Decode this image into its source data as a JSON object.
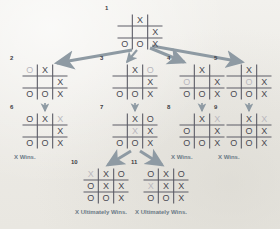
{
  "diagram": {
    "colors": {
      "background": "#efeeea",
      "grid_line": "#5c5c66",
      "mark": "#4a4a52",
      "mark_new": "#b9b7bd",
      "arrow": "#8e9aa3",
      "caption": "#6b7a86",
      "number": "#3c3c44"
    },
    "mark_symbols": {
      "x": "X",
      "o": "O",
      "empty": ""
    }
  },
  "nodes": [
    {
      "id": "node-1",
      "number": "1",
      "x": 117,
      "y": 14,
      "rows": [
        [
          "",
          "x",
          ""
        ],
        [
          "",
          "",
          "x"
        ],
        [
          "o",
          "o",
          "x"
        ]
      ],
      "new_cells": [],
      "caption": ""
    },
    {
      "id": "node-2",
      "number": "2",
      "x": 22,
      "y": 64,
      "rows": [
        [
          "o",
          "x",
          ""
        ],
        [
          "",
          "",
          "x"
        ],
        [
          "o",
          "o",
          "x"
        ]
      ],
      "new_cells": [
        [
          0,
          0
        ]
      ],
      "caption": ""
    },
    {
      "id": "node-3",
      "number": "3",
      "x": 112,
      "y": 64,
      "rows": [
        [
          "",
          "x",
          "o"
        ],
        [
          "",
          "",
          "x"
        ],
        [
          "o",
          "o",
          "x"
        ]
      ],
      "new_cells": [
        [
          0,
          2
        ]
      ],
      "caption": ""
    },
    {
      "id": "node-4",
      "number": "4",
      "x": 179,
      "y": 64,
      "rows": [
        [
          "",
          "x",
          ""
        ],
        [
          "o",
          "",
          "x"
        ],
        [
          "o",
          "o",
          "x"
        ]
      ],
      "new_cells": [
        [
          1,
          0
        ]
      ],
      "caption": ""
    },
    {
      "id": "node-5",
      "number": "5",
      "x": 226,
      "y": 64,
      "rows": [
        [
          "",
          "x",
          ""
        ],
        [
          "",
          "o",
          "x"
        ],
        [
          "o",
          "o",
          "x"
        ]
      ],
      "new_cells": [
        [
          1,
          1
        ]
      ],
      "caption": ""
    },
    {
      "id": "node-6",
      "number": "6",
      "x": 22,
      "y": 113,
      "rows": [
        [
          "o",
          "x",
          "x"
        ],
        [
          "",
          "",
          "x"
        ],
        [
          "o",
          "o",
          "x"
        ]
      ],
      "new_cells": [
        [
          0,
          2
        ]
      ],
      "caption": "X Wins."
    },
    {
      "id": "node-7",
      "number": "7",
      "x": 112,
      "y": 113,
      "rows": [
        [
          "",
          "x",
          "o"
        ],
        [
          "",
          "x",
          "x"
        ],
        [
          "o",
          "o",
          "x"
        ]
      ],
      "new_cells": [
        [
          1,
          1
        ]
      ],
      "caption": ""
    },
    {
      "id": "node-8",
      "number": "8",
      "x": 179,
      "y": 113,
      "rows": [
        [
          "",
          "x",
          "x"
        ],
        [
          "o",
          "",
          "x"
        ],
        [
          "o",
          "o",
          "x"
        ]
      ],
      "new_cells": [
        [
          0,
          2
        ]
      ],
      "caption": "X Wins."
    },
    {
      "id": "node-9",
      "number": "9",
      "x": 226,
      "y": 113,
      "rows": [
        [
          "",
          "x",
          "x"
        ],
        [
          "",
          "o",
          "x"
        ],
        [
          "o",
          "o",
          "x"
        ]
      ],
      "new_cells": [
        [
          0,
          2
        ]
      ],
      "caption": "X Wins."
    },
    {
      "id": "node-10",
      "number": "10",
      "x": 83,
      "y": 168,
      "rows": [
        [
          "x",
          "x",
          "o"
        ],
        [
          "o",
          "x",
          "x"
        ],
        [
          "o",
          "o",
          "x"
        ]
      ],
      "new_cells": [
        [
          0,
          0
        ]
      ],
      "caption": "X Ultimately Wins."
    },
    {
      "id": "node-11",
      "number": "11",
      "x": 143,
      "y": 168,
      "rows": [
        [
          "o",
          "x",
          "o"
        ],
        [
          "x",
          "x",
          "x"
        ],
        [
          "o",
          "o",
          "x"
        ]
      ],
      "new_cells": [
        [
          1,
          0
        ]
      ],
      "caption": "X Ultimately Wins."
    }
  ],
  "edges": [
    {
      "id": "edge-1-2",
      "from": "node-1",
      "to": "node-2",
      "kind": "fan"
    },
    {
      "id": "edge-1-3",
      "from": "node-1",
      "to": "node-3",
      "kind": "fan"
    },
    {
      "id": "edge-1-4",
      "from": "node-1",
      "to": "node-4",
      "kind": "fan"
    },
    {
      "id": "edge-1-5",
      "from": "node-1",
      "to": "node-5",
      "kind": "fan"
    },
    {
      "id": "edge-2-6",
      "from": "node-2",
      "to": "node-6",
      "kind": "down"
    },
    {
      "id": "edge-3-7",
      "from": "node-3",
      "to": "node-7",
      "kind": "down"
    },
    {
      "id": "edge-4-8",
      "from": "node-4",
      "to": "node-8",
      "kind": "down"
    },
    {
      "id": "edge-5-9",
      "from": "node-5",
      "to": "node-9",
      "kind": "down"
    },
    {
      "id": "edge-7-10",
      "from": "node-7",
      "to": "node-10",
      "kind": "fan"
    },
    {
      "id": "edge-7-11",
      "from": "node-7",
      "to": "node-11",
      "kind": "fan"
    }
  ]
}
